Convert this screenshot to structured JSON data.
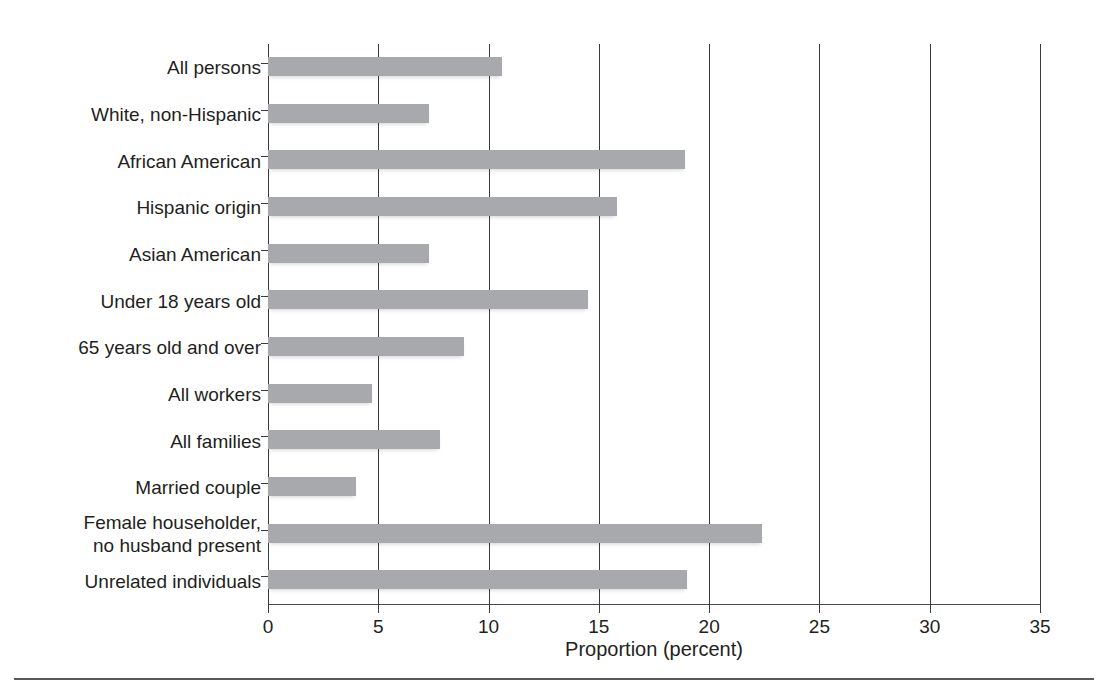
{
  "chart_data": {
    "type": "bar",
    "orientation": "horizontal",
    "title": "",
    "xlabel": "Proportion (percent)",
    "ylabel": "",
    "xlim": [
      0,
      35
    ],
    "xticks": [
      0,
      5,
      10,
      15,
      20,
      25,
      30,
      35
    ],
    "xtick_labels": [
      "0",
      "5",
      "10",
      "15",
      "20",
      "25",
      "30",
      "35"
    ],
    "grid": "vertical",
    "legend": "none",
    "bar_color": "#a7a9ac",
    "categories": [
      "All persons",
      "White, non-Hispanic",
      "African American",
      "Hispanic origin",
      "Asian American",
      "Under 18 years old",
      "65 years old and over",
      "All workers",
      "All families",
      "Married couple",
      "Female householder,\nno husband present",
      "Unrelated individuals"
    ],
    "values": [
      10.6,
      7.3,
      18.9,
      15.8,
      7.3,
      14.5,
      8.9,
      4.7,
      7.8,
      4.0,
      22.4,
      19.0
    ]
  },
  "category_lines": [
    [
      "All persons"
    ],
    [
      "White, non-Hispanic"
    ],
    [
      "African American"
    ],
    [
      "Hispanic origin"
    ],
    [
      "Asian American"
    ],
    [
      "Under 18 years old"
    ],
    [
      "65 years old and over"
    ],
    [
      "All workers"
    ],
    [
      "All families"
    ],
    [
      "Married couple"
    ],
    [
      "Female householder,",
      "no husband present"
    ],
    [
      "Unrelated individuals"
    ]
  ]
}
